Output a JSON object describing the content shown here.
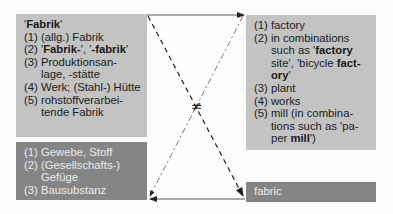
{
  "source_box": {
    "headword": "Fabrik",
    "senses": [
      {
        "num": "(1) ",
        "text": "(allg.) Fabrik"
      },
      {
        "num": "(2) ",
        "parts": [
          "'",
          "Fabrik-",
          "', '",
          "-fabrik",
          "'"
        ]
      },
      {
        "num": "(3) ",
        "text": "Produktionsan-lage, -stätte"
      },
      {
        "num": "(4) ",
        "text": "Werk; (Stahl-) Hütte"
      },
      {
        "num": "(5) ",
        "text": "rohstoffverarbei-tende Fabrik"
      }
    ]
  },
  "false_friend_box": {
    "senses": [
      {
        "num": "(1) ",
        "text": "Gewebe, Stoff"
      },
      {
        "num": "(2) ",
        "text": "(Gesellschafts-) Gefüge"
      },
      {
        "num": "(3) ",
        "text": "Bausubstanz"
      }
    ]
  },
  "target_box": {
    "senses": [
      {
        "num": "(1) ",
        "text": "factory"
      },
      {
        "num": "(2) ",
        "text_a": "in combinations such as '",
        "bold_a": "factory",
        "text_b": " site', 'bicycle ",
        "bold_b": "fact-ory",
        "text_c": "'"
      },
      {
        "num": "(3) ",
        "text": "plant"
      },
      {
        "num": "(4) ",
        "text": "works"
      },
      {
        "num": "(5) ",
        "text_a": "mill (in combina-tions such as 'pa-per ",
        "bold_a": "mill",
        "text_b": "')"
      }
    ]
  },
  "english_word_box": {
    "label": "fabric"
  },
  "relation_symbol": "≠",
  "colors": {
    "light_box": "#c3c3c3",
    "dark_box": "#858585",
    "line": "#333333"
  }
}
